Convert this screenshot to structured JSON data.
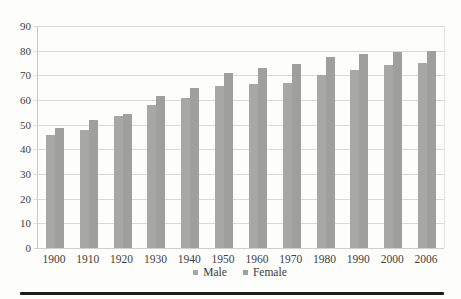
{
  "figure": {
    "background": "#fdfdfc"
  },
  "chart_data": {
    "type": "bar",
    "title": "",
    "xlabel": "",
    "ylabel": "",
    "categories": [
      "1900",
      "1910",
      "1920",
      "1930",
      "1940",
      "1950",
      "1960",
      "1970",
      "1980",
      "1990",
      "2000",
      "2006"
    ],
    "series": [
      {
        "name": "Male",
        "color": "#a7a7a5",
        "values": [
          46,
          48,
          53.5,
          58,
          61,
          65.5,
          66.5,
          67,
          70,
          72,
          74,
          75
        ]
      },
      {
        "name": "Female",
        "color": "#9f9f9d",
        "values": [
          48.5,
          52,
          54.5,
          61.5,
          65,
          71,
          73,
          74.5,
          77.5,
          78.5,
          79.5,
          80
        ]
      }
    ],
    "ylim": [
      0,
      90
    ],
    "ytick_step": 10,
    "yticks": [
      "0",
      "10",
      "20",
      "30",
      "40",
      "50",
      "60",
      "70",
      "80",
      "90"
    ],
    "grid": true,
    "gridline_color": "#d9d9d7",
    "legend_position": "bottom-center",
    "legend_labels": [
      "Male",
      "Female"
    ]
  },
  "colors": {
    "axis_text": "#3e3e3c",
    "page_rule": "#1c1c1c"
  }
}
